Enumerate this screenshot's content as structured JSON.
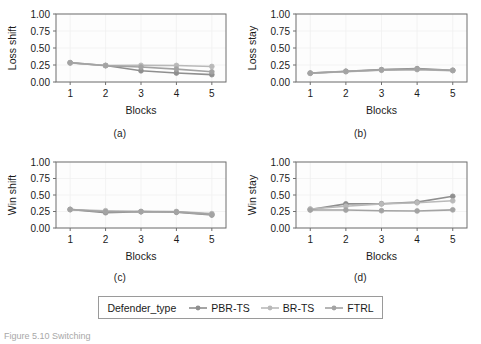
{
  "figure": {
    "caption": "Figure 5.10  Switching",
    "panel_tags": [
      "(a)",
      "(b)",
      "(c)",
      "(d)"
    ]
  },
  "legend": {
    "title": "Defender_type",
    "entries": [
      {
        "label": "PBR-TS",
        "color": "#8f8f8f"
      },
      {
        "label": "BR-TS",
        "color": "#b9b9b9"
      },
      {
        "label": "FTRL",
        "color": "#a3a3a3"
      }
    ]
  },
  "axis": {
    "xlabel": "Blocks",
    "x_ticks": [
      "1",
      "2",
      "3",
      "4",
      "5"
    ],
    "y_ticks": [
      "0.00",
      "0.25",
      "0.50",
      "0.75",
      "1.00"
    ]
  },
  "chart_data": [
    {
      "type": "line",
      "panel": "(a)",
      "title": "",
      "xlabel": "Blocks",
      "ylabel": "Loss shift",
      "x": [
        1,
        2,
        3,
        4,
        5
      ],
      "xlim": [
        0.6,
        5.4
      ],
      "ylim": [
        0.0,
        1.0
      ],
      "yticks": [
        0.0,
        0.25,
        0.5,
        0.75,
        1.0
      ],
      "grid": true,
      "legend_position": "bottom-shared",
      "series": [
        {
          "name": "PBR-TS",
          "color": "#8f8f8f",
          "values": [
            0.285,
            0.243,
            0.165,
            0.132,
            0.108
          ]
        },
        {
          "name": "BR-TS",
          "color": "#b9b9b9",
          "values": [
            0.28,
            0.243,
            0.245,
            0.243,
            0.228
          ]
        },
        {
          "name": "FTRL",
          "color": "#a3a3a3",
          "values": [
            0.282,
            0.24,
            0.22,
            0.19,
            0.15
          ]
        }
      ]
    },
    {
      "type": "line",
      "panel": "(b)",
      "title": "",
      "xlabel": "Blocks",
      "ylabel": "Loss stay",
      "x": [
        1,
        2,
        3,
        4,
        5
      ],
      "xlim": [
        0.6,
        5.4
      ],
      "ylim": [
        0.0,
        1.0
      ],
      "yticks": [
        0.0,
        0.25,
        0.5,
        0.75,
        1.0
      ],
      "grid": true,
      "legend_position": "bottom-shared",
      "series": [
        {
          "name": "PBR-TS",
          "color": "#8f8f8f",
          "values": [
            0.13,
            0.158,
            0.182,
            0.196,
            0.172
          ]
        },
        {
          "name": "BR-TS",
          "color": "#b9b9b9",
          "values": [
            0.128,
            0.152,
            0.172,
            0.182,
            0.168
          ]
        },
        {
          "name": "FTRL",
          "color": "#a3a3a3",
          "values": [
            0.13,
            0.155,
            0.178,
            0.188,
            0.17
          ]
        }
      ]
    },
    {
      "type": "line",
      "panel": "(c)",
      "title": "",
      "xlabel": "Blocks",
      "ylabel": "Win shift",
      "x": [
        1,
        2,
        3,
        4,
        5
      ],
      "xlim": [
        0.6,
        5.4
      ],
      "ylim": [
        0.0,
        1.0
      ],
      "yticks": [
        0.0,
        0.25,
        0.5,
        0.75,
        1.0
      ],
      "grid": true,
      "legend_position": "bottom-shared",
      "series": [
        {
          "name": "PBR-TS",
          "color": "#8f8f8f",
          "values": [
            0.282,
            0.232,
            0.248,
            0.238,
            0.196
          ]
        },
        {
          "name": "BR-TS",
          "color": "#b9b9b9",
          "values": [
            0.278,
            0.262,
            0.248,
            0.25,
            0.218
          ]
        },
        {
          "name": "FTRL",
          "color": "#a3a3a3",
          "values": [
            0.28,
            0.246,
            0.248,
            0.244,
            0.206
          ]
        }
      ]
    },
    {
      "type": "line",
      "panel": "(d)",
      "title": "",
      "xlabel": "Blocks",
      "ylabel": "Win stay",
      "x": [
        1,
        2,
        3,
        4,
        5
      ],
      "xlim": [
        0.6,
        5.4
      ],
      "ylim": [
        0.0,
        1.0
      ],
      "yticks": [
        0.0,
        0.25,
        0.5,
        0.75,
        1.0
      ],
      "grid": true,
      "legend_position": "bottom-shared",
      "series": [
        {
          "name": "PBR-TS",
          "color": "#8f8f8f",
          "values": [
            0.28,
            0.365,
            0.368,
            0.392,
            0.48
          ]
        },
        {
          "name": "BR-TS",
          "color": "#b9b9b9",
          "values": [
            0.288,
            0.33,
            0.365,
            0.382,
            0.412
          ]
        },
        {
          "name": "FTRL",
          "color": "#a3a3a3",
          "values": [
            0.272,
            0.272,
            0.262,
            0.258,
            0.275
          ]
        }
      ]
    }
  ]
}
